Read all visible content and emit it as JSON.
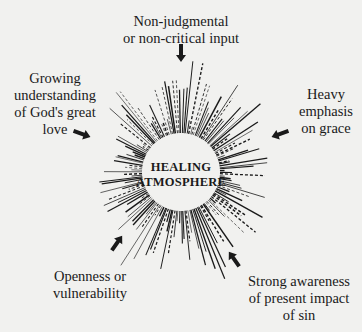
{
  "diagram": {
    "center_label": [
      "HEALING",
      "ATMOSPHERE"
    ],
    "factors": [
      {
        "id": "top",
        "text": "Non-judgmental\nor non-critical input",
        "arrow": "arrow-down-icon"
      },
      {
        "id": "left",
        "text": "Growing\nunderstanding\nof God's great\nlove",
        "arrow": "arrow-right-icon"
      },
      {
        "id": "right",
        "text": "Heavy\nemphasis\non grace",
        "arrow": "arrow-left-icon"
      },
      {
        "id": "bottom-left",
        "text": "Openness or\nvulnerability",
        "arrow": "arrow-up-right-icon"
      },
      {
        "id": "bottom-right",
        "text": "Strong awareness\nof present impact\nof sin",
        "arrow": "arrow-up-left-icon"
      }
    ],
    "ink_color": "#1a1a1a",
    "background_color": "#f1f1ef"
  }
}
